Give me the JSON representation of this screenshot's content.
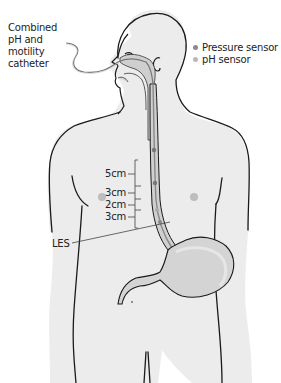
{
  "figure": {
    "callouts": {
      "catheter_line1": "Combined",
      "catheter_line2": "pH and",
      "catheter_line3": "motility",
      "catheter_line4": "catheter",
      "les": "LES"
    },
    "legend": [
      {
        "label": "Pressure sensor",
        "color": "#8a8a8a",
        "icon": "pressure-sensor-dot"
      },
      {
        "label": "pH sensor",
        "color": "#b8b8b8",
        "icon": "ph-sensor-dot"
      }
    ],
    "scale_marks": [
      {
        "label": "5cm"
      },
      {
        "label": "3cm"
      },
      {
        "label": "2cm"
      },
      {
        "label": "3cm"
      }
    ],
    "colors": {
      "body_fill": "#ececec",
      "outline": "#1a1a1a",
      "organ_fill": "#d4d4d4",
      "background": "#ffffff"
    }
  }
}
